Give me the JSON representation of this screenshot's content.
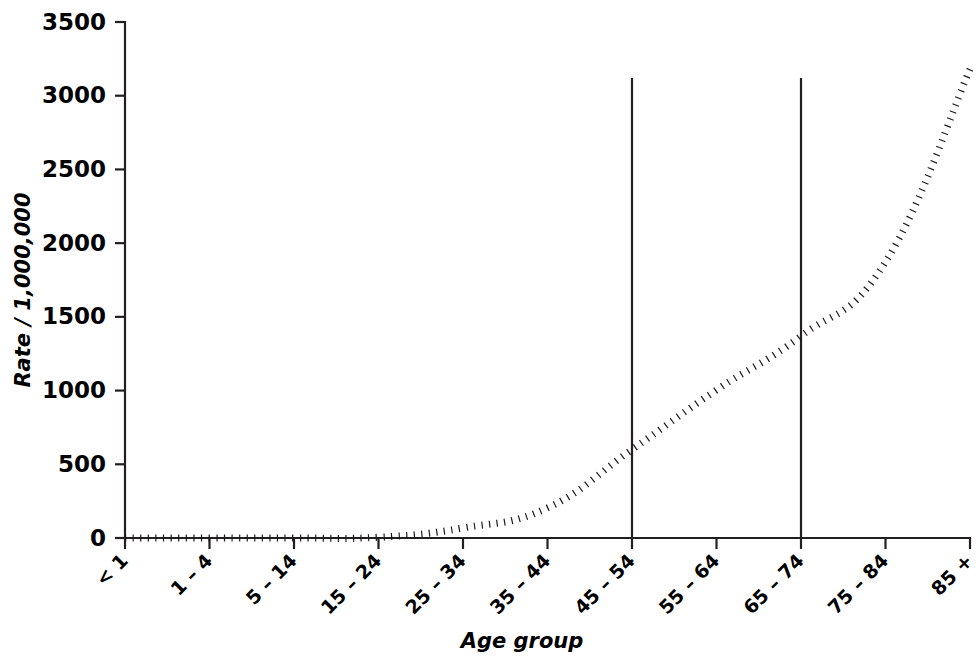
{
  "chart_data": {
    "type": "line",
    "title": "",
    "subtitle": "",
    "xlabel": "Age group",
    "ylabel": "Rate / 1,000,000",
    "categories": [
      "< 1",
      "1 – 4",
      "5 – 14",
      "15 – 24",
      "25 – 34",
      "35 – 44",
      "45 – 54",
      "55 – 64",
      "65 – 74",
      "75 – 84",
      "85 +"
    ],
    "values": [
      0,
      0,
      0,
      5,
      68,
      204,
      600,
      1004,
      1370,
      1872,
      3180
    ],
    "series": [
      {
        "name": "Rate per 1,000,000",
        "values": [
          0,
          0,
          0,
          5,
          68,
          204,
          600,
          1004,
          1370,
          1872,
          3180
        ],
        "style": "dotted",
        "color": "#1a1a1a"
      }
    ],
    "xlim": [
      0,
      10
    ],
    "ylim": [
      0,
      3500
    ],
    "yticks": [
      0,
      500,
      1000,
      1500,
      2000,
      2500,
      3000,
      3500
    ],
    "ytick_labels": [
      "0",
      "500",
      "1000",
      "1500",
      "2000",
      "2500",
      "3000",
      "3500"
    ],
    "grid": false,
    "legend": false,
    "legend_position": "none",
    "xtick_label_rotation": 45,
    "annotations": [
      {
        "type": "vertical-reference-line",
        "category": "45 – 54",
        "x_index": 6,
        "y_top": 3120,
        "y_bottom": 0,
        "color": "#231f20"
      },
      {
        "type": "vertical-reference-line",
        "category": "65 – 74",
        "x_index": 8,
        "y_top": 3120,
        "y_bottom": 0,
        "color": "#231f20"
      }
    ]
  },
  "colors": {
    "background": "#ffffff",
    "axis": "#231f20",
    "data_line": "#1a1a1a",
    "text": "#000000"
  }
}
